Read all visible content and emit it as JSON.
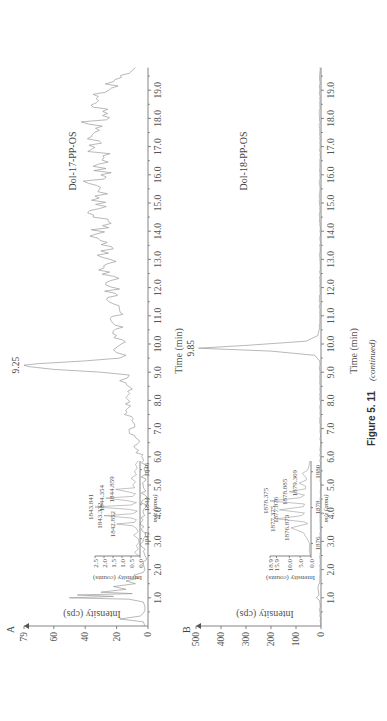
{
  "figure": {
    "caption_number": "Figure 5. 11",
    "caption_suffix": "(continued)"
  },
  "chart_data": [
    {
      "type": "line",
      "panel": "A",
      "title": "Dol-17-PP-OS",
      "xlabel": "Time (min)",
      "ylabel": "Intensity (cps)",
      "xlim": [
        0,
        19.8
      ],
      "ylim": [
        0,
        79
      ],
      "x_ticks": [
        "1.0",
        "2.0",
        "3.0",
        "4.0",
        "5.0",
        "6.0",
        "7.0",
        "8.0",
        "9.0",
        "10.0",
        "11.0",
        "12.0",
        "13.0",
        "14.0",
        "15.0",
        "16.0",
        "17.0",
        "18.0",
        "19.0"
      ],
      "y_ticks": [
        "0",
        "20",
        "40",
        "60",
        "79"
      ],
      "annotations": [
        {
          "text": "9.25",
          "x": 9.25,
          "y": 79
        }
      ],
      "series": [
        {
          "name": "Dol-17-PP-OS",
          "x": [
            0,
            0.15,
            0.25,
            0.35,
            0.45,
            0.55,
            0.7,
            0.85,
            0.95,
            1.0,
            1.05,
            1.1,
            1.15,
            1.2,
            1.3,
            1.4,
            1.5,
            1.6,
            1.7,
            1.8,
            1.9,
            2.0,
            2.2,
            2.5,
            2.8,
            3.0,
            3.3,
            3.6,
            4.0,
            4.5,
            5.0,
            5.5,
            6.0,
            6.3,
            6.6,
            6.9,
            7.2,
            7.5,
            7.8,
            8.1,
            8.4,
            8.7,
            8.9,
            9.0,
            9.1,
            9.2,
            9.25,
            9.3,
            9.4,
            9.5,
            9.6,
            9.8,
            10.0,
            10.3,
            10.6,
            10.9,
            11.2,
            11.5,
            11.8,
            12.1,
            12.4,
            12.7,
            13.0,
            13.3,
            13.6,
            13.9,
            14.2,
            14.5,
            14.8,
            15.1,
            15.4,
            15.7,
            16.0,
            16.3,
            16.6,
            16.9,
            17.2,
            17.5,
            17.8,
            18.1,
            18.4,
            18.7,
            19.0,
            19.3,
            19.6,
            19.8
          ],
          "y": [
            2,
            3,
            18,
            5,
            3,
            2,
            2,
            3,
            12,
            50,
            22,
            45,
            10,
            30,
            14,
            22,
            8,
            14,
            6,
            9,
            3,
            2,
            3,
            2,
            4,
            3,
            2,
            5,
            3,
            2,
            3,
            2,
            4,
            8,
            6,
            12,
            9,
            15,
            11,
            14,
            10,
            18,
            12,
            30,
            60,
            76,
            79,
            70,
            40,
            18,
            14,
            22,
            17,
            20,
            16,
            24,
            18,
            25,
            21,
            27,
            22,
            28,
            24,
            30,
            26,
            33,
            29,
            35,
            31,
            36,
            32,
            38,
            30,
            35,
            28,
            36,
            31,
            34,
            38,
            29,
            35,
            33,
            25,
            22,
            12,
            8
          ]
        }
      ],
      "inset": {
        "xlabel": "m/z (amu)",
        "ylabel": "Intensity (counts)",
        "x_ticks": [
          "1842",
          "1844",
          "1846"
        ],
        "y_ticks": [
          "0.0",
          "0.5",
          "1.0",
          "1.5",
          "2.0",
          "2.5"
        ],
        "xlim": [
          1841,
          1846.5
        ],
        "ylim": [
          0,
          2.5
        ],
        "peak_labels": [
          {
            "text": "1842.852",
            "x": 1842.852,
            "y": 1.3
          },
          {
            "text": "1843.332",
            "x": 1843.332,
            "y": 2.0
          },
          {
            "text": "1843.841",
            "x": 1843.841,
            "y": 2.5
          },
          {
            "text": "1844.354",
            "x": 1844.354,
            "y": 1.9
          },
          {
            "text": "1844.859",
            "x": 1844.859,
            "y": 1.35
          }
        ],
        "series": [
          {
            "name": "MS spectrum A",
            "x": [
              1841,
              1841.2,
              1841.4,
              1841.6,
              1841.8,
              1842.0,
              1842.2,
              1842.4,
              1842.6,
              1842.75,
              1842.852,
              1842.95,
              1843.1,
              1843.2,
              1843.332,
              1843.45,
              1843.6,
              1843.7,
              1843.841,
              1843.95,
              1844.1,
              1844.2,
              1844.354,
              1844.45,
              1844.6,
              1844.7,
              1844.859,
              1844.95,
              1845.1,
              1845.3,
              1845.5,
              1845.7,
              1845.9,
              1846.1,
              1846.3,
              1846.5
            ],
            "y": [
              0.05,
              0.3,
              0.1,
              0.2,
              0.05,
              0.1,
              0.35,
              0.1,
              0.2,
              0.4,
              1.3,
              0.3,
              0.2,
              0.5,
              2.0,
              0.4,
              0.15,
              0.6,
              2.5,
              0.5,
              0.2,
              0.7,
              1.9,
              0.4,
              0.25,
              0.6,
              1.35,
              0.3,
              0.4,
              0.25,
              0.5,
              0.2,
              0.3,
              0.15,
              0.25,
              0.1
            ]
          }
        ]
      }
    },
    {
      "type": "line",
      "panel": "B",
      "title": "Dol-18-PP-OS",
      "xlabel": "Time (min)",
      "ylabel": "Intensity (cps)",
      "xlim": [
        0,
        19.8
      ],
      "ylim": [
        0,
        500
      ],
      "x_ticks": [
        "1.0",
        "2.0",
        "3.0",
        "4.0",
        "5.0",
        "6.0",
        "7.0",
        "8.0",
        "9.0",
        "10.0",
        "11.0",
        "12.0",
        "13.0",
        "14.0",
        "15.0",
        "16.0",
        "17.0",
        "18.0",
        "19.0"
      ],
      "y_ticks": [
        "0",
        "100",
        "200",
        "300",
        "400",
        "500"
      ],
      "annotations": [
        {
          "text": "9.85",
          "x": 9.85,
          "y": 490
        }
      ],
      "series": [
        {
          "name": "Dol-18-PP-OS",
          "x": [
            0,
            0.5,
            0.9,
            1.0,
            1.1,
            1.3,
            1.6,
            2.0,
            3.0,
            4.0,
            5.0,
            6.0,
            7.0,
            8.0,
            9.0,
            9.4,
            9.6,
            9.75,
            9.85,
            9.95,
            10.1,
            10.3,
            10.6,
            11.0,
            12.0,
            13.0,
            14.0,
            15.0,
            16.0,
            17.0,
            18.0,
            19.0,
            19.8
          ],
          "y": [
            3,
            4,
            6,
            18,
            8,
            12,
            5,
            4,
            3,
            3,
            2,
            3,
            3,
            4,
            4,
            6,
            25,
            200,
            490,
            300,
            60,
            12,
            6,
            5,
            4,
            5,
            4,
            6,
            5,
            4,
            6,
            5,
            4
          ]
        }
      ],
      "inset": {
        "xlabel": "m/z (amu)",
        "ylabel": "Intensity (counts)",
        "x_ticks": [
          "1876",
          "1878",
          "1880"
        ],
        "y_ticks": [
          "0.0",
          "5.0",
          "10.0",
          "15.9",
          "18.9"
        ],
        "xlim": [
          1875.3,
          1880.6
        ],
        "ylim": [
          0,
          18.9
        ],
        "peak_labels": [
          {
            "text": "1876.873",
            "x": 1876.873,
            "y": 9.2
          },
          {
            "text": "1877.375",
            "x": 1877.375,
            "y": 15.9
          },
          {
            "text": "1877.876",
            "x": 1877.876,
            "y": 14.5
          },
          {
            "text": "1878.375",
            "x": 1878.375,
            "y": 18.9
          },
          {
            "text": "1878.885",
            "x": 1878.885,
            "y": 10.0
          },
          {
            "text": "1879.369",
            "x": 1879.369,
            "y": 5.5
          }
        ],
        "series": [
          {
            "name": "MS spectrum B",
            "x": [
              1875.3,
              1875.6,
              1876.0,
              1876.3,
              1876.6,
              1876.873,
              1877.1,
              1877.2,
              1877.375,
              1877.55,
              1877.7,
              1877.876,
              1878.05,
              1878.2,
              1878.375,
              1878.55,
              1878.7,
              1878.885,
              1879.05,
              1879.2,
              1879.369,
              1879.55,
              1879.7,
              1879.9,
              1880.1,
              1880.3,
              1880.6
            ],
            "y": [
              0.3,
              0.8,
              0.6,
              2.0,
              3.5,
              9.2,
              1.5,
              3.0,
              15.9,
              4.5,
              3.0,
              14.5,
              3.5,
              3.0,
              18.9,
              5.0,
              3.0,
              10.0,
              2.5,
              2.5,
              5.5,
              2.0,
              2.5,
              4.0,
              1.5,
              1.0,
              0.5
            ]
          }
        ]
      }
    }
  ]
}
